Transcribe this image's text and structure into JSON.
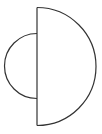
{
  "figure": {
    "stroke_color": "#333333",
    "background": "#ffffff",
    "shapes": {
      "large_semicircle": {
        "side": "right",
        "center_x": 37,
        "center_y": 66.5,
        "radius": 59
      },
      "small_semicircle": {
        "side": "left",
        "center_x": 37,
        "center_y": 66,
        "radius": 30
      },
      "diameter_line": {
        "x": 37,
        "y1": 7.5,
        "y2": 125.5
      }
    }
  }
}
